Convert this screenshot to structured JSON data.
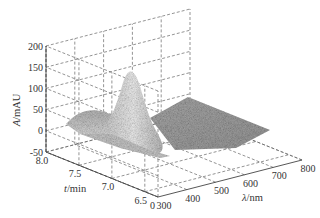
{
  "chart_data": {
    "type": "surface3d",
    "title": "",
    "x_axis": {
      "label_italic": "λ",
      "label_unit": "/nm",
      "ticks": [
        "300",
        "400",
        "500",
        "600",
        "700",
        "800"
      ],
      "range": [
        300,
        800
      ]
    },
    "y_axis": {
      "label_italic": "t",
      "label_unit": "/min",
      "ticks": [
        "8.0",
        "7.5",
        "7.0",
        "6.5"
      ],
      "range": [
        6.3,
        8.0
      ]
    },
    "z_axis": {
      "label_italic": "A",
      "label_unit": "/mAU",
      "ticks": [
        "200",
        "150",
        "100",
        "50",
        "0",
        "-50"
      ],
      "range": [
        -50,
        200
      ]
    },
    "grid": true,
    "grid_style": "dashed",
    "colormap": "grayscale",
    "features": [
      {
        "name": "main peak",
        "lambda_nm": 400,
        "t_min": 7.2,
        "A_mAU": 130
      },
      {
        "name": "shoulder",
        "lambda_nm": 320,
        "t_min": 7.6,
        "A_mAU": 35
      },
      {
        "name": "baseline plateau",
        "lambda_nm_range": [
          450,
          800
        ],
        "A_mAU": 0
      }
    ],
    "corner_label": "0"
  }
}
